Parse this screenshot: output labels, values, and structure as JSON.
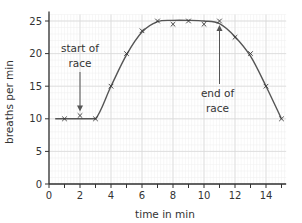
{
  "chart_data": {
    "type": "line",
    "title": "",
    "xlabel": "time in min",
    "ylabel": "breaths per min",
    "xlim": [
      0,
      15.3
    ],
    "ylim": [
      0,
      26
    ],
    "grid": true,
    "x_ticks": [
      0,
      2,
      4,
      6,
      8,
      10,
      12,
      14
    ],
    "y_ticks": [
      0,
      5,
      10,
      15,
      20,
      25
    ],
    "series": [
      {
        "name": "breathing rate",
        "marker": "x",
        "x": [
          1,
          2,
          3,
          4,
          5,
          6,
          7,
          8,
          9,
          10,
          11,
          12,
          13,
          14,
          15
        ],
        "values": [
          10,
          10.5,
          10,
          15,
          20,
          23.5,
          25,
          24.5,
          25,
          24.5,
          25,
          22.5,
          20,
          15,
          10
        ]
      }
    ],
    "annotations": [
      {
        "text_lines": [
          "start of",
          "race"
        ],
        "points_to_x": 2,
        "points_to_y": 10.5
      },
      {
        "text_lines": [
          "end of",
          "race"
        ],
        "points_to_x": 11,
        "points_to_y": 25
      }
    ],
    "legend": null
  },
  "colors": {
    "axis": "#333333",
    "curve": "#555555",
    "grid_major": "#d9d9d9",
    "grid_minor": "#eeeeee"
  }
}
